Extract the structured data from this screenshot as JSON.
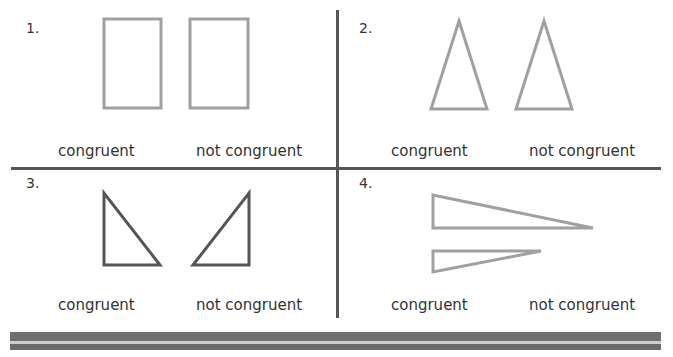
{
  "problems": [
    {
      "number": "1.",
      "options": [
        "congruent",
        "not congruent"
      ],
      "shape": "rectangles"
    },
    {
      "number": "2.",
      "options": [
        "congruent",
        "not congruent"
      ],
      "shape": "isosceles-triangles"
    },
    {
      "number": "3.",
      "options": [
        "congruent",
        "not congruent"
      ],
      "shape": "right-triangles-mirrored"
    },
    {
      "number": "4.",
      "options": [
        "congruent",
        "not congruent"
      ],
      "shape": "long-thin-triangles"
    }
  ],
  "colors": {
    "shape_light": "#a0a0a0",
    "shape_dark": "#555555",
    "divider": "#555555"
  }
}
